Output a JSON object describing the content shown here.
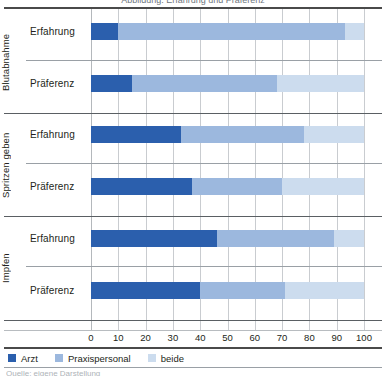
{
  "figure": {
    "top_title_clipped": "Abbildung: Erfahrung und Präferenz",
    "bottom_caption_clipped": "Quelle: eigene Darstellung"
  },
  "legend": {
    "items": [
      {
        "label": "Arzt",
        "color": "#2b5fad"
      },
      {
        "label": "Praxispersonal",
        "color": "#9cb8de"
      },
      {
        "label": "beide",
        "color": "#ccdcee"
      }
    ]
  },
  "axis": {
    "ticks": [
      "0",
      "10",
      "20",
      "30",
      "40",
      "50",
      "60",
      "70",
      "80",
      "90",
      "100"
    ]
  },
  "groups": [
    {
      "name": "Blutabnahme"
    },
    {
      "name": "Spritzen geben"
    },
    {
      "name": "Impfen"
    }
  ],
  "rows": [
    {
      "label": "Erfahrung"
    },
    {
      "label": "Präferenz"
    },
    {
      "label": "Erfahrung"
    },
    {
      "label": "Präferenz"
    },
    {
      "label": "Erfahrung"
    },
    {
      "label": "Präferenz"
    }
  ],
  "chart_data": {
    "type": "bar",
    "orientation": "horizontal",
    "stacked": true,
    "stack_total": 100,
    "title": "",
    "xlabel": "",
    "ylabel": "",
    "xlim": [
      0,
      100
    ],
    "xticks": [
      0,
      10,
      20,
      30,
      40,
      50,
      60,
      70,
      80,
      90,
      100
    ],
    "grid": "vertical",
    "legend_position": "bottom-left",
    "group_labels": [
      "Blutabnahme",
      "Spritzen geben",
      "Impfen"
    ],
    "categories": [
      "Blutabnahme – Erfahrung",
      "Blutabnahme – Präferenz",
      "Spritzen geben – Erfahrung",
      "Spritzen geben – Präferenz",
      "Impfen – Erfahrung",
      "Impfen – Präferenz"
    ],
    "series": [
      {
        "name": "Arzt",
        "color": "#2b5fad",
        "values": [
          10,
          15,
          33,
          37,
          46,
          40
        ]
      },
      {
        "name": "Praxispersonal",
        "color": "#9cb8de",
        "values": [
          83,
          53,
          45,
          33,
          43,
          31
        ]
      },
      {
        "name": "beide",
        "color": "#ccdcee",
        "values": [
          7,
          32,
          22,
          30,
          11,
          29
        ]
      }
    ]
  }
}
